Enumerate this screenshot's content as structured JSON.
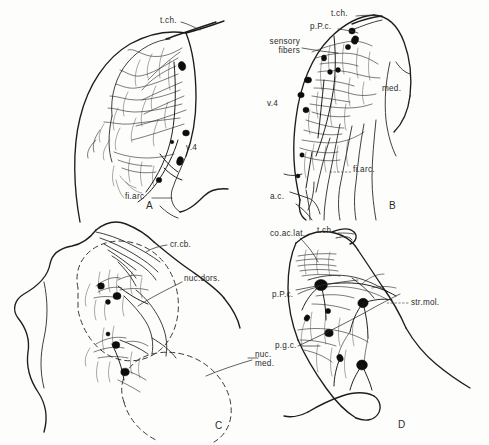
{
  "figure": {
    "type": "neuroanatomical-line-drawing",
    "technique": "Golgi / reduced-silver style pen-and-ink drawing",
    "background_color": "#fdfdfc",
    "ink_color": "#1d1d1d",
    "panel_count": 4
  },
  "panels": [
    {
      "id": "A",
      "letter": "A",
      "letter_pos": {
        "x": 146,
        "y": 205
      },
      "subject": "dorsal cochlear nucleus region with afferent fiber plexus",
      "labels": [
        {
          "key": "t_ch",
          "text": "t.ch.",
          "x": 160,
          "y": 21,
          "align": "left"
        },
        {
          "key": "v4",
          "text": "v.4",
          "x": 186,
          "y": 148,
          "align": "left"
        },
        {
          "key": "fi_arc",
          "text": "fi.arc",
          "x": 128,
          "y": 197,
          "align": "left"
        }
      ]
    },
    {
      "id": "B",
      "letter": "B",
      "letter_pos": {
        "x": 389,
        "y": 205
      },
      "subject": "sensory fiber terminals, principal cell layer and arcuate fibers",
      "labels": [
        {
          "key": "t_ch",
          "text": "t.ch.",
          "x": 335,
          "y": 13,
          "align": "left"
        },
        {
          "key": "p_p_c",
          "text": "p.P.c.",
          "x": 312,
          "y": 26,
          "align": "left"
        },
        {
          "key": "sensory",
          "text": "sensory\nfibers",
          "x": 269,
          "y": 41,
          "align": "left"
        },
        {
          "key": "v4",
          "text": "v.4",
          "x": 268,
          "y": 103,
          "align": "left"
        },
        {
          "key": "med",
          "text": "med.",
          "x": 383,
          "y": 88,
          "align": "left"
        },
        {
          "key": "fi_arc",
          "text": "fi.arc.",
          "x": 354,
          "y": 169,
          "align": "left"
        },
        {
          "key": "ac",
          "text": "a.c.",
          "x": 272,
          "y": 196,
          "align": "left"
        }
      ]
    },
    {
      "id": "C",
      "letter": "C",
      "letter_pos": {
        "x": 215,
        "y": 425
      },
      "subject": "cochlear nuclear complex — dorsal and medial (ventral) nuclei outlines",
      "labels": [
        {
          "key": "cr_cb",
          "text": "cr.cb.",
          "x": 172,
          "y": 244,
          "align": "left"
        },
        {
          "key": "nuc_dors",
          "text": "nuc.dors.",
          "x": 185,
          "y": 278,
          "align": "left"
        },
        {
          "key": "nuc_med",
          "text": "nuc.\nmed.",
          "x": 256,
          "y": 355,
          "align": "left"
        }
      ]
    },
    {
      "id": "D",
      "letter": "D",
      "letter_pos": {
        "x": 398,
        "y": 424
      },
      "subject": "dorsal cochlear nucleus — molecular layer, principal cells, granule cells",
      "labels": [
        {
          "key": "co_ac_lat",
          "text": "co.ac.lat.",
          "x": 272,
          "y": 233,
          "align": "left"
        },
        {
          "key": "t_ch",
          "text": "t.ch.",
          "x": 319,
          "y": 230,
          "align": "left"
        },
        {
          "key": "p_p_c",
          "text": "p.P.c.",
          "x": 274,
          "y": 294,
          "align": "left"
        },
        {
          "key": "str_mol",
          "text": "str.mol.",
          "x": 412,
          "y": 302,
          "align": "left"
        },
        {
          "key": "p_g_c",
          "text": "p.g.c.",
          "x": 277,
          "y": 345,
          "align": "left"
        }
      ]
    }
  ],
  "abbreviations": [
    {
      "abbr": "t.ch.",
      "meaning": "tractus cochlearis"
    },
    {
      "abbr": "v.4",
      "meaning": "ventriculus quartus"
    },
    {
      "abbr": "fi.arc.",
      "meaning": "fibrae arcuatae"
    },
    {
      "abbr": "p.P.c.",
      "meaning": "pars principalis cochlearis"
    },
    {
      "abbr": "med.",
      "meaning": "medulla"
    },
    {
      "abbr": "a.c.",
      "meaning": "ala cinerea"
    },
    {
      "abbr": "cr.cb.",
      "meaning": "crus cerebelli"
    },
    {
      "abbr": "nuc.dors.",
      "meaning": "nucleus dorsalis"
    },
    {
      "abbr": "nuc.med.",
      "meaning": "nucleus medialis"
    },
    {
      "abbr": "co.ac.lat.",
      "meaning": "cochlearis acusticus lateralis"
    },
    {
      "abbr": "str.mol.",
      "meaning": "stratum moleculare"
    },
    {
      "abbr": "p.g.c.",
      "meaning": "pars granularis cellularis"
    }
  ]
}
